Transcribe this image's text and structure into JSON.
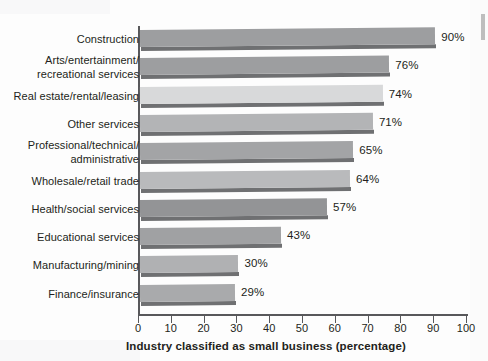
{
  "chart_data": {
    "type": "bar",
    "orientation": "horizontal",
    "title": "",
    "xlabel": "Industry classified as small business (percentage)",
    "ylabel": "",
    "xlim": [
      0,
      100
    ],
    "xticks": [
      0,
      10,
      20,
      30,
      40,
      50,
      60,
      70,
      80,
      90,
      100
    ],
    "xtick_labels": [
      "0",
      "10",
      "20",
      "30",
      "40",
      "50",
      "60",
      "70",
      "80",
      "90",
      "100"
    ],
    "grid": false,
    "legend": null,
    "value_label_suffix": "%",
    "categories": [
      "Construction",
      "Arts/entertainment/\nrecreational services",
      "Real estate/rental/leasing",
      "Other services",
      "Professional/technical/\nadministrative",
      "Wholesale/retail trade",
      "Health/social services",
      "Educational services",
      "Manufacturing/mining",
      "Finance/insurance"
    ],
    "values": [
      90,
      76,
      74,
      71,
      65,
      64,
      57,
      43,
      30,
      29
    ],
    "value_labels": [
      "90%",
      "76%",
      "74%",
      "71%",
      "65%",
      "64%",
      "57%",
      "43%",
      "30%",
      "29%"
    ],
    "bar_colors": [
      "#9d9ea0",
      "#9d9ea0",
      "#d8d9da",
      "#b3b4b6",
      "#a3a4a6",
      "#b9babc",
      "#939496",
      "#a0a1a3",
      "#b0b1b3",
      "#a9aaac"
    ],
    "shadow_color": "#6f7072",
    "axis_color": "#58585b",
    "background_color": "#fdfdfd",
    "text_color": "#231f20"
  }
}
